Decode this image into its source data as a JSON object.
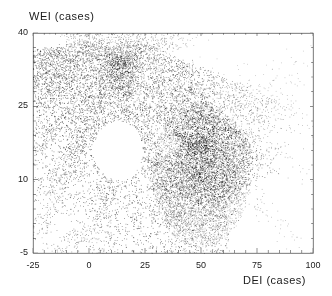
{
  "chart_data": {
    "type": "scatter",
    "title": "",
    "xlabel": "DEI (cases)",
    "ylabel": "WEI (cases)",
    "xlim": [
      -25,
      100
    ],
    "ylim": [
      -5,
      40
    ],
    "xticks": [
      -25,
      0,
      25,
      50,
      75,
      100
    ],
    "xtick_labels": [
      "-25",
      "0",
      "25",
      "50",
      "75",
      "100"
    ],
    "yticks": [
      -5,
      10,
      25,
      40
    ],
    "ytick_labels": [
      "-5",
      "10",
      "25",
      "40"
    ],
    "x_minor_tick_step": 5,
    "y_minor_tick_step": 3,
    "grid": false,
    "legend": false,
    "marker": "point",
    "marker_color": "#000000",
    "point_count": 22000,
    "structures": [
      {
        "name": "upper-band",
        "role": "dense upper caustic arm sweeping from the upper-left tip rightwards and down then up to a second peak",
        "points": 7200,
        "path": [
          {
            "x": -19.0,
            "y": 37.0,
            "spread": 1.0
          },
          {
            "x": -16.5,
            "y": 33.0,
            "spread": 1.6
          },
          {
            "x": -13.0,
            "y": 29.5,
            "spread": 2.2
          },
          {
            "x": -8.0,
            "y": 26.5,
            "spread": 2.6
          },
          {
            "x": -1.0,
            "y": 24.2,
            "spread": 2.8
          },
          {
            "x": 8.0,
            "y": 22.8,
            "spread": 2.9
          },
          {
            "x": 17.0,
            "y": 22.4,
            "spread": 2.9
          },
          {
            "x": 26.0,
            "y": 23.4,
            "spread": 2.8
          },
          {
            "x": 34.0,
            "y": 25.8,
            "spread": 2.6
          },
          {
            "x": 40.0,
            "y": 28.6,
            "spread": 2.3
          },
          {
            "x": 44.5,
            "y": 31.6,
            "spread": 1.9
          },
          {
            "x": 47.0,
            "y": 33.4,
            "spread": 1.4
          }
        ]
      },
      {
        "name": "lower-band",
        "role": "dense lower caustic arm from the tip descending steeply to the lower right lobe",
        "points": 6400,
        "path": [
          {
            "x": -19.0,
            "y": 36.0,
            "spread": 1.0
          },
          {
            "x": -16.0,
            "y": 31.0,
            "spread": 1.4
          },
          {
            "x": -12.0,
            "y": 25.5,
            "spread": 1.8
          },
          {
            "x": -7.0,
            "y": 20.5,
            "spread": 2.0
          },
          {
            "x": -1.0,
            "y": 16.0,
            "spread": 2.1
          },
          {
            "x": 6.0,
            "y": 12.0,
            "spread": 2.2
          },
          {
            "x": 14.0,
            "y": 8.5,
            "spread": 2.3
          },
          {
            "x": 22.0,
            "y": 5.6,
            "spread": 2.5
          },
          {
            "x": 31.0,
            "y": 3.0,
            "spread": 2.7
          },
          {
            "x": 40.0,
            "y": 0.8,
            "spread": 2.8
          },
          {
            "x": 48.0,
            "y": -0.9,
            "spread": 2.8
          },
          {
            "x": 56.0,
            "y": -2.0,
            "spread": 2.6
          },
          {
            "x": 63.0,
            "y": -2.3,
            "spread": 2.4
          }
        ]
      },
      {
        "name": "right-lobe",
        "role": "broad diffuse right-hand lobe filling the fold between the two arms",
        "points": 6800,
        "center": {
          "x": 50.0,
          "y": 11.0
        },
        "rx": 22.0,
        "ry": 15.0
      },
      {
        "name": "caustic-ridge-upper",
        "role": "bright inner caustic streak converging from upper right toward the cusp at (42,17)",
        "points": 900,
        "path": [
          {
            "x": 62.0,
            "y": 22.5,
            "spread": 1.1
          },
          {
            "x": 55.0,
            "y": 20.6,
            "spread": 1.0
          },
          {
            "x": 48.0,
            "y": 18.9,
            "spread": 0.9
          },
          {
            "x": 42.0,
            "y": 17.2,
            "spread": 0.8
          }
        ]
      },
      {
        "name": "caustic-ridge-lower",
        "role": "bright inner caustic streak running down-right from the cusp",
        "points": 900,
        "path": [
          {
            "x": 42.0,
            "y": 16.6,
            "spread": 0.8
          },
          {
            "x": 48.0,
            "y": 13.0,
            "spread": 0.9
          },
          {
            "x": 54.0,
            "y": 9.4,
            "spread": 1.0
          },
          {
            "x": 60.0,
            "y": 6.2,
            "spread": 1.1
          }
        ]
      },
      {
        "name": "void",
        "role": "empty region between the two arms",
        "center": {
          "x": 13.0,
          "y": 16.0
        },
        "rx": 11.0,
        "ry": 6.0
      }
    ]
  },
  "axes": {
    "y_title": "WEI (cases)",
    "x_title": "DEI (cases)"
  }
}
